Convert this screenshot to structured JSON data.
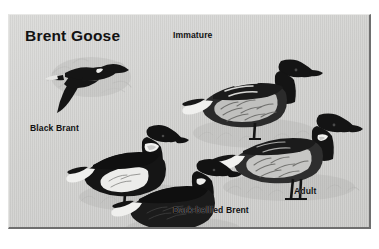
{
  "plate": {
    "title": "Brent Goose",
    "background_color": "#d2d2d0",
    "ink_color": "#121212",
    "frame_border_color": "#6e6e6e",
    "page_background": "#ffffff"
  },
  "labels": [
    {
      "id": "immature",
      "text": "Immature",
      "x": 172,
      "y": 29,
      "for": "immature-goose"
    },
    {
      "id": "black-brant",
      "text": "Black Brant",
      "x": 29,
      "y": 122,
      "for": "black-brant-goose"
    },
    {
      "id": "dark-bellied",
      "text": "Dark-bellied Brent",
      "x": 172,
      "y": 204,
      "for": "dark-bellied-brent-goose"
    },
    {
      "id": "adult",
      "text": "Adult",
      "x": 293,
      "y": 185,
      "for": "adult-goose"
    }
  ],
  "figures": [
    {
      "id": "flying-goose",
      "name": "brent-goose-in-flight",
      "pose": "flying",
      "plumage": "dark body, black head and neck, white neck collar, pale vent",
      "x": 38,
      "y": 42,
      "width": 88,
      "height": 68
    },
    {
      "id": "immature-goose",
      "name": "immature-brent-goose",
      "pose": "standing",
      "plumage": "black head and neck, grey barred flanks, bold pale wing-bars, white rear",
      "x": 178,
      "y": 42,
      "width": 130,
      "height": 90
    },
    {
      "id": "adult-goose",
      "name": "adult-brent-goose",
      "pose": "standing",
      "plumage": "black head and neck with white neck collar, pale grey flanks, white rear",
      "x": 210,
      "y": 100,
      "width": 135,
      "height": 84
    },
    {
      "id": "black-brant-goose",
      "name": "black-brant-goose",
      "pose": "standing",
      "plumage": "blackish body with bold white flank patch, broad white neck collar",
      "x": 68,
      "y": 114,
      "width": 118,
      "height": 78
    },
    {
      "id": "dark-bellied-brent-goose",
      "name": "dark-bellied-brent-goose",
      "pose": "standing",
      "plumage": "uniformly dark body and belly, narrow white neck collar, white rear",
      "x": 112,
      "y": 148,
      "width": 120,
      "height": 78
    }
  ]
}
